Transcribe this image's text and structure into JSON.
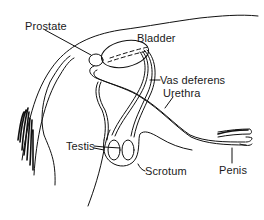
{
  "diagram": {
    "type": "anatomical-line-drawing",
    "stroke_color": "#111111",
    "background": "#ffffff",
    "labels": [
      {
        "id": "prostate",
        "text": "Prostate",
        "x": 25,
        "y": 21
      },
      {
        "id": "bladder",
        "text": "Bladder",
        "x": 137,
        "y": 33
      },
      {
        "id": "vas_deferens",
        "text": "Vas deferens",
        "x": 160,
        "y": 75
      },
      {
        "id": "urethra",
        "text": "Urethra",
        "x": 163,
        "y": 88
      },
      {
        "id": "testis",
        "text": "Testis",
        "x": 66,
        "y": 141
      },
      {
        "id": "scrotum",
        "text": "Scrotum",
        "x": 145,
        "y": 166
      },
      {
        "id": "penis",
        "text": "Penis",
        "x": 219,
        "y": 165
      }
    ]
  }
}
